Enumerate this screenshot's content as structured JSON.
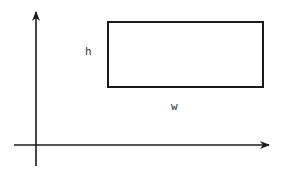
{
  "diagram": {
    "type": "rectangle-on-axes",
    "labels": {
      "height": "h",
      "width": "w"
    },
    "colors": {
      "stroke": "#1a1a1a",
      "background": "#ffffff",
      "text": "#333333"
    }
  }
}
